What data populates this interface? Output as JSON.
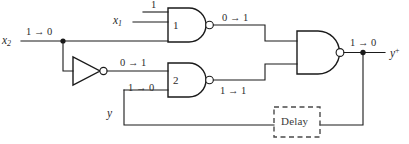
{
  "diagram": {
    "type": "logic-circuit",
    "line_color": "#1a1a1a",
    "delay_border_color": "#4a4a4a",
    "background": "#ffffff"
  },
  "inputs": {
    "x1": {
      "name": "x",
      "subscript": "1",
      "value_label": "1"
    },
    "x2": {
      "name": "x",
      "subscript": "2",
      "value_label": "1 → 0"
    },
    "y": {
      "name": "y",
      "subscript": "",
      "value_label": ""
    }
  },
  "outputs": {
    "y_next": {
      "name": "y",
      "superscript": "+",
      "value_label": "1 → 0"
    }
  },
  "gates": [
    {
      "id": "gate-1",
      "kind": "nand",
      "number_label": "1",
      "output_value_label": "0 → 1"
    },
    {
      "id": "gate-2",
      "kind": "nand",
      "number_label": "2",
      "output_value_label": "1 → 1"
    },
    {
      "id": "gate-3",
      "kind": "nand",
      "number_label": "",
      "output_value_label": "1 → 0"
    },
    {
      "id": "inverter",
      "kind": "not",
      "number_label": "",
      "output_value_label": "0 → 1"
    }
  ],
  "wire_labels": {
    "x1_input": "1",
    "x2_input": "1 → 0",
    "inverter_output": "0 → 1",
    "gate1_output": "0 → 1",
    "gate2_lower_input": "1 → 0",
    "gate2_output": "1 → 1",
    "gate3_output": "1 → 0",
    "feedback_y": "y"
  },
  "delay": {
    "label": "Delay",
    "style": "dashed"
  }
}
